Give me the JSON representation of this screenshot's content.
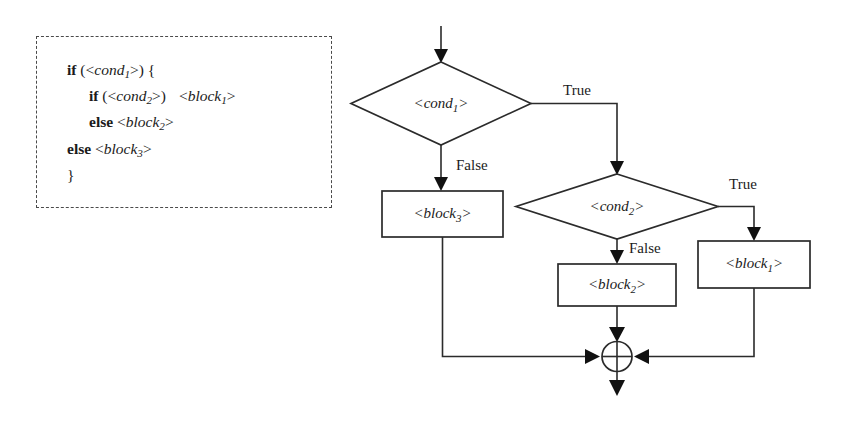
{
  "figure": {
    "type": "flowchart"
  },
  "code_panel": {
    "border_style": "dashed",
    "lines": [
      {
        "indent": 1,
        "keyword": "if",
        "rest": " (<",
        "placeholder": "cond",
        "sub": "1",
        "tail": ">) {"
      },
      {
        "indent": 2,
        "keyword": "if",
        "rest": " (<",
        "placeholder": "cond",
        "sub": "2",
        "tail": ">)",
        "second_placeholder": "block",
        "second_sub": "1"
      },
      {
        "indent": 2,
        "keyword": "else",
        "placeholder": "block",
        "sub": "2"
      },
      {
        "indent": 1,
        "keyword": "else",
        "placeholder": "block",
        "sub": "3"
      },
      {
        "indent": 1,
        "keyword": "",
        "tail": "}"
      }
    ],
    "text_lines": [
      "if (<cond1>) {",
      "if (<cond2>)  <block1>",
      "else <block2>",
      "else <block3>",
      "}"
    ]
  },
  "flowchart": {
    "colors": {
      "stroke": "#2b2b2b",
      "fill": "#ffffff",
      "text": "#1b1b1b",
      "arrow": "#111111"
    },
    "nodes": [
      {
        "id": "entry",
        "kind": "entry-arrow",
        "label": ""
      },
      {
        "id": "cond1",
        "kind": "decision",
        "base": "cond",
        "sub": "1",
        "label": "<cond1>"
      },
      {
        "id": "cond2",
        "kind": "decision",
        "base": "cond",
        "sub": "2",
        "label": "<cond2>"
      },
      {
        "id": "block3",
        "kind": "process",
        "base": "block",
        "sub": "3",
        "label": "<block3>"
      },
      {
        "id": "block2",
        "kind": "process",
        "base": "block",
        "sub": "2",
        "label": "<block2>"
      },
      {
        "id": "block1",
        "kind": "process",
        "base": "block",
        "sub": "1",
        "label": "<block1>"
      },
      {
        "id": "merge",
        "kind": "connector",
        "label": ""
      },
      {
        "id": "exit",
        "kind": "exit-arrow",
        "label": ""
      }
    ],
    "edge_labels": [
      {
        "id": "cond1-true",
        "text": "True"
      },
      {
        "id": "cond1-false",
        "text": "False"
      },
      {
        "id": "cond2-true",
        "text": "True"
      },
      {
        "id": "cond2-false",
        "text": "False"
      }
    ]
  }
}
